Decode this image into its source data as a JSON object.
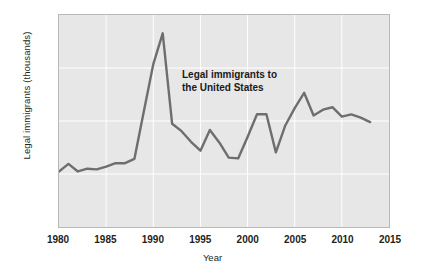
{
  "chart_data": {
    "type": "line",
    "title": "",
    "xlabel": "Year",
    "ylabel": "Legal immigrants (thousands)",
    "xlim": [
      1980,
      2015
    ],
    "ylim": [
      0,
      2000
    ],
    "xticks": [
      1980,
      1985,
      1990,
      1995,
      2000,
      2005,
      2010,
      2015
    ],
    "xtick_labels": [
      "1980",
      "1985",
      "1990",
      "1995",
      "2000",
      "2005",
      "2010",
      "2015"
    ],
    "yticks": [
      0,
      500,
      1000,
      1500,
      2000
    ],
    "ytick_labels": [
      "0",
      "500",
      "1,000",
      "1,500",
      "2,000"
    ],
    "grid": true,
    "grid_color": "#ffffff",
    "plot_background": "#e7e7e7",
    "line_color": "#6e6e6e",
    "legend": "none",
    "annotations": [
      {
        "text": "Legal immigrants to\nthe United States",
        "x": 1992.5,
        "y": 1480
      }
    ],
    "series": [
      {
        "name": "Legal immigrants to the United States",
        "x": [
          1980,
          1981,
          1982,
          1983,
          1984,
          1985,
          1986,
          1987,
          1988,
          1989,
          1990,
          1991,
          1992,
          1993,
          1994,
          1995,
          1996,
          1997,
          1998,
          1999,
          2000,
          2001,
          2002,
          2003,
          2004,
          2005,
          2006,
          2007,
          2008,
          2009,
          2010,
          2011,
          2012,
          2013
        ],
        "values": [
          524,
          596,
          524,
          550,
          544,
          570,
          602,
          602,
          643,
          1091,
          1536,
          1827,
          974,
          904,
          804,
          720,
          916,
          798,
          654,
          647,
          850,
          1064,
          1063,
          704,
          958,
          1122,
          1266,
          1052,
          1107,
          1130,
          1042,
          1062,
          1031,
          990
        ]
      }
    ]
  }
}
